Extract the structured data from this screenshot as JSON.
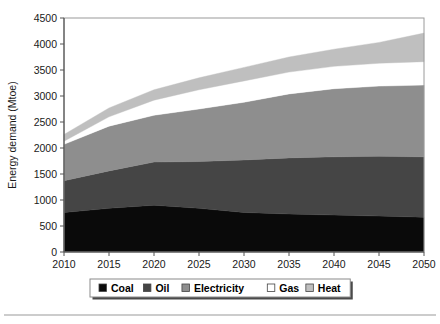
{
  "chart_data": {
    "type": "area",
    "stacked": true,
    "title": "",
    "xlabel": "",
    "ylabel": "Energy demand (Mtoe)",
    "x": [
      2010,
      2015,
      2020,
      2025,
      2030,
      2035,
      2040,
      2045,
      2050
    ],
    "xticklabels": [
      "2010",
      "2015",
      "2020",
      "2025",
      "2030",
      "2035",
      "2040",
      "2045",
      "2050"
    ],
    "yticklabels": [
      "0",
      "500",
      "1000",
      "1500",
      "2000",
      "2500",
      "3000",
      "3500",
      "4000",
      "4500"
    ],
    "yticks": [
      0,
      500,
      1000,
      1500,
      2000,
      2500,
      3000,
      3500,
      4000,
      4500
    ],
    "xlim": [
      2010,
      2050
    ],
    "ylim": [
      0,
      4500
    ],
    "grid": false,
    "legend_position": "below",
    "series": [
      {
        "name": "Coal",
        "color": "#0a0a0a",
        "values": [
          760,
          840,
          900,
          840,
          760,
          730,
          710,
          690,
          670
        ]
      },
      {
        "name": "Oil",
        "color": "#454545",
        "values": [
          610,
          720,
          830,
          900,
          1010,
          1080,
          1120,
          1150,
          1160
        ]
      },
      {
        "name": "Electricity",
        "color": "#8e8e8e",
        "values": [
          700,
          860,
          900,
          1010,
          1110,
          1230,
          1310,
          1350,
          1380
        ]
      },
      {
        "name": "Gas",
        "color": "#ffffff",
        "values": [
          60,
          180,
          290,
          370,
          410,
          420,
          430,
          440,
          450
        ]
      },
      {
        "name": "Heat",
        "color": "#bfbfbf",
        "values": [
          130,
          170,
          200,
          230,
          260,
          290,
          330,
          400,
          550
        ]
      }
    ],
    "stack_totals": [
      2260,
      2770,
      3120,
      3350,
      3550,
      3750,
      3900,
      4030,
      4210
    ]
  },
  "legend": {
    "items": [
      {
        "label": "Coal",
        "color": "#0a0a0a"
      },
      {
        "label": "Oil",
        "color": "#454545"
      },
      {
        "label": "Electricity",
        "color": "#8e8e8e"
      },
      {
        "label": "Gas",
        "color": "#ffffff"
      },
      {
        "label": "Heat",
        "color": "#bfbfbf"
      }
    ]
  }
}
